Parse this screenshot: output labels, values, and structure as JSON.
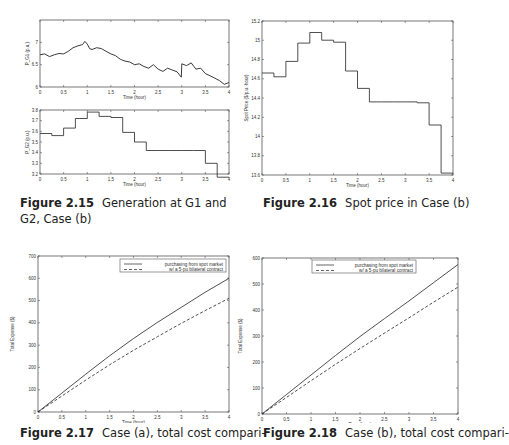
{
  "chart_data": [
    {
      "id": "fig-2-15-top",
      "type": "line",
      "title": "",
      "xlabel": "Time (hour)",
      "ylabel": "P_G1 (p.u.)",
      "xlim": [
        0,
        4
      ],
      "ylim": [
        6,
        7.5
      ],
      "xticks": [
        "0",
        "0.5",
        "1",
        "1.5",
        "2",
        "2.5",
        "3",
        "3.5",
        "4"
      ],
      "yticks": [
        "6",
        "6.5",
        "7"
      ],
      "series": [
        {
          "name": "P_G1",
          "style": "solid",
          "x": [
            0,
            0.1,
            0.2,
            0.3,
            0.4,
            0.5,
            0.6,
            0.7,
            0.8,
            0.9,
            0.95,
            1.0,
            1.05,
            1.1,
            1.2,
            1.3,
            1.4,
            1.5,
            1.6,
            1.7,
            1.8,
            1.9,
            2.0,
            2.1,
            2.2,
            2.3,
            2.4,
            2.5,
            2.6,
            2.7,
            2.8,
            2.9,
            2.99,
            3.0,
            3.1,
            3.2,
            3.3,
            3.4,
            3.5,
            3.6,
            3.7,
            3.8,
            3.9,
            4.0
          ],
          "y": [
            6.72,
            6.74,
            6.68,
            6.72,
            6.75,
            6.74,
            6.8,
            6.88,
            6.92,
            6.95,
            7.02,
            6.96,
            6.86,
            6.84,
            6.88,
            6.86,
            6.8,
            6.74,
            6.7,
            6.62,
            6.58,
            6.56,
            6.5,
            6.52,
            6.46,
            6.42,
            6.5,
            6.4,
            6.35,
            6.42,
            6.38,
            6.34,
            6.22,
            6.52,
            6.48,
            6.54,
            6.4,
            6.42,
            6.3,
            6.25,
            6.2,
            6.14,
            6.06,
            6.1
          ]
        }
      ]
    },
    {
      "id": "fig-2-15-bottom",
      "type": "line",
      "title": "",
      "xlabel": "Time (hour)",
      "ylabel": "P_G2 (p.u.)",
      "xlim": [
        0,
        4
      ],
      "ylim": [
        3.2,
        3.8
      ],
      "xticks": [
        "0",
        "0.5",
        "1",
        "1.5",
        "2",
        "2.5",
        "3",
        "3.5",
        "4"
      ],
      "yticks": [
        "3.2",
        "3.3",
        "3.4",
        "3.5",
        "3.6",
        "3.7",
        "3.8"
      ],
      "series": [
        {
          "name": "P_G2",
          "style": "step",
          "x": [
            0,
            0.25,
            0.5,
            0.75,
            1.0,
            1.25,
            1.5,
            1.75,
            2.0,
            2.25,
            2.5,
            2.75,
            3.0,
            3.25,
            3.5,
            3.75,
            4.0
          ],
          "y": [
            3.58,
            3.56,
            3.63,
            3.72,
            3.78,
            3.74,
            3.73,
            3.59,
            3.5,
            3.42,
            3.42,
            3.42,
            3.42,
            3.42,
            3.3,
            3.17,
            3.17
          ]
        }
      ]
    },
    {
      "id": "fig-2-16",
      "type": "line",
      "title": "",
      "xlabel": "Time (hour)",
      "ylabel": "Spot Price ($/p.u.-hour)",
      "xlim": [
        0,
        4
      ],
      "ylim": [
        13.6,
        15.2
      ],
      "xticks": [
        "0",
        "0.5",
        "1",
        "1.5",
        "2",
        "2.5",
        "3",
        "3.5",
        "4"
      ],
      "yticks": [
        "13.6",
        "13.8",
        "14",
        "14.2",
        "14.4",
        "14.6",
        "14.8",
        "15",
        "15.2"
      ],
      "series": [
        {
          "name": "Spot price",
          "style": "step",
          "x": [
            0,
            0.25,
            0.5,
            0.75,
            1.0,
            1.25,
            1.5,
            1.75,
            2.0,
            2.25,
            2.5,
            2.75,
            3.0,
            3.25,
            3.5,
            3.75,
            4.0
          ],
          "y": [
            14.66,
            14.62,
            14.78,
            14.97,
            15.08,
            15.0,
            14.98,
            14.68,
            14.5,
            14.36,
            14.36,
            14.36,
            14.36,
            14.35,
            14.12,
            13.62,
            13.62
          ]
        }
      ]
    },
    {
      "id": "fig-2-17",
      "type": "line",
      "title": "",
      "xlabel": "Time (hour)",
      "ylabel": "Total Expense ($)",
      "xlim": [
        0,
        4
      ],
      "ylim": [
        0,
        700
      ],
      "xticks": [
        "0",
        "0.5",
        "1",
        "1.5",
        "2",
        "2.5",
        "3",
        "3.5",
        "4"
      ],
      "yticks": [
        "0",
        "100",
        "200",
        "300",
        "400",
        "500",
        "600",
        "700"
      ],
      "legend_position": "upper right",
      "series": [
        {
          "name": "purchasing from spot market",
          "style": "solid",
          "x": [
            0,
            0.5,
            1,
            1.5,
            2,
            2.5,
            3,
            3.5,
            4
          ],
          "y": [
            0,
            85,
            170,
            252,
            330,
            402,
            470,
            537,
            600
          ]
        },
        {
          "name": "w/ a 5-pu bilateral contract",
          "style": "dashed",
          "x": [
            0,
            0.5,
            1,
            1.5,
            2,
            2.5,
            3,
            3.5,
            4
          ],
          "y": [
            0,
            72,
            143,
            212,
            277,
            338,
            398,
            455,
            510
          ]
        }
      ]
    },
    {
      "id": "fig-2-18",
      "type": "line",
      "title": "",
      "xlabel": "Time (hour)",
      "ylabel": "Total Expense ($)",
      "xlim": [
        0,
        4
      ],
      "ylim": [
        0,
        600
      ],
      "xticks": [
        "0",
        "0.5",
        "1",
        "1.5",
        "2",
        "2.5",
        "3",
        "3.5",
        "4"
      ],
      "yticks": [
        "0",
        "100",
        "200",
        "300",
        "400",
        "500",
        "600"
      ],
      "legend_position": "upper center",
      "series": [
        {
          "name": "purchasing from spot market",
          "style": "solid",
          "x": [
            0,
            0.5,
            1,
            1.5,
            2,
            2.5,
            3,
            3.5,
            4
          ],
          "y": [
            0,
            75,
            150,
            225,
            298,
            367,
            435,
            505,
            575
          ]
        },
        {
          "name": "w/ a 5-pu bilateral contract",
          "style": "dashed",
          "x": [
            0,
            0.5,
            1,
            1.5,
            2,
            2.5,
            3,
            3.5,
            4
          ],
          "y": [
            0,
            64,
            128,
            191,
            252,
            311,
            370,
            430,
            488
          ]
        }
      ]
    }
  ],
  "captions": {
    "fig215": {
      "label": "Figure 2.15",
      "text": "Generation at G1 and G2, Case (b)"
    },
    "fig216": {
      "label": "Figure 2.16",
      "text": "Spot price in Case (b)"
    },
    "fig217": {
      "label": "Figure 2.17",
      "text": "Case (a), total cost compari-"
    },
    "fig218": {
      "label": "Figure 2.18",
      "text": "Case (b), total cost compari-"
    }
  }
}
